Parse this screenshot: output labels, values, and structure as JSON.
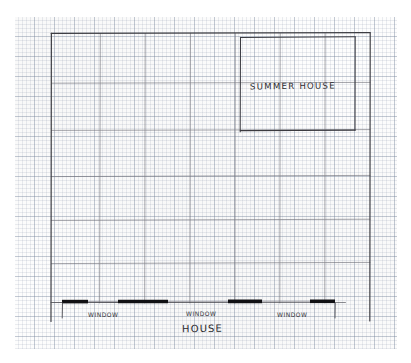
{
  "sheet": {
    "background": "#ffffff",
    "paper": {
      "type": "graph-paper",
      "grid_minor_px": 4,
      "grid_major_px": 20,
      "grid_color": "#8c98ac",
      "left": 15,
      "top": 17,
      "width": 382,
      "height": 332
    }
  },
  "drawing": {
    "medium": "pencil-sketch",
    "ink_color": "#3a3a3e",
    "title": "HOUSE",
    "labels": {
      "summer_house": "SUMMER HOUSE",
      "house": "HOUSE",
      "window_1": "WINDOW",
      "window_2": "WINDOW",
      "window_3": "WINDOW"
    },
    "main_outline": {
      "name": "house-outline",
      "left": 51,
      "top": 33,
      "right": 370,
      "bottom": 303
    },
    "summer_house": {
      "name": "summer-house-outline",
      "left": 240,
      "top": 37,
      "right": 355,
      "bottom": 130
    },
    "interior_horizontal_lines_y": [
      83,
      130,
      176,
      220,
      263
    ],
    "interior_vertical_lines_x": [
      100,
      145,
      190,
      235,
      280,
      325
    ],
    "front_wall": {
      "y": 303,
      "start_x": 51,
      "end_x": 345,
      "segments": [
        {
          "kind": "wall",
          "x1": 51,
          "x2": 62
        },
        {
          "kind": "wall",
          "x1": 62,
          "x2": 88
        },
        {
          "kind": "window",
          "x1": 88,
          "x2": 118
        },
        {
          "kind": "wall",
          "x1": 118,
          "x2": 168
        },
        {
          "kind": "window",
          "x1": 168,
          "x2": 228
        },
        {
          "kind": "wall",
          "x1": 228,
          "x2": 262
        },
        {
          "kind": "window",
          "x1": 262,
          "x2": 310
        },
        {
          "kind": "wall",
          "x1": 310,
          "x2": 335
        },
        {
          "kind": "wall",
          "x1": 335,
          "x2": 345
        }
      ]
    }
  }
}
